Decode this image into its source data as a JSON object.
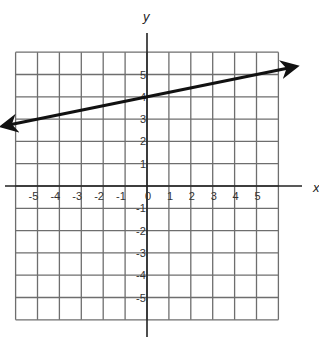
{
  "chart_data": {
    "type": "line",
    "title": "",
    "xlabel": "x",
    "ylabel": "y",
    "xlim": [
      -6,
      6
    ],
    "ylim": [
      -6,
      6
    ],
    "grid": true,
    "x_ticks": [
      "-5",
      "-4",
      "-3",
      "-2",
      "-1",
      "0",
      "1",
      "2",
      "3",
      "4",
      "5"
    ],
    "y_ticks": [
      "5",
      "4",
      "3",
      "2",
      "1",
      "-1",
      "-2",
      "-3",
      "-4",
      "-5"
    ],
    "series": [
      {
        "name": "line",
        "equation": "y = (1/5)x + 4",
        "slope": 0.2,
        "intercept": 4,
        "arrows": "both",
        "x": [
          -6.6,
          -5,
          0,
          5,
          6.8
        ],
        "y": [
          2.68,
          3,
          4,
          5,
          5.36
        ]
      }
    ]
  },
  "labels": {
    "x_axis": "x",
    "y_axis": "y"
  },
  "colors": {
    "grid": "#6e6e6e",
    "axis": "#222222",
    "line": "#111111"
  }
}
